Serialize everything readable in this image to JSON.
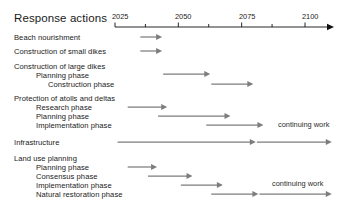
{
  "chart_data": {
    "type": "bar",
    "title": "Response actions",
    "xlabel": "",
    "ylabel": "",
    "xlim": [
      2020,
      2112
    ],
    "grid": false,
    "legend": null,
    "axis": {
      "major_ticks": [
        2025,
        2050,
        2075,
        2100
      ],
      "major_tick_labels": [
        "2025",
        "2050",
        "2075",
        "2100"
      ],
      "minor_ticks": [
        2037,
        2062,
        2087
      ],
      "arrow_end": true
    },
    "annotations": [
      "continuing work",
      "continuing work"
    ],
    "categories": [
      "Beach nourishment",
      "Construction of small dikes",
      "Construction of large dikes",
      "Planning phase",
      "Construction phase",
      "Protection of atolls and deltas",
      "Research phase",
      "Planning phase",
      "Implementation phase",
      "Infrastructure",
      "Land use planning",
      "Planning phase",
      "Consensus phase",
      "Implementation phase",
      "Natural restoration phase"
    ],
    "bars": [
      {
        "label": "Beach nourishment",
        "start": 2035,
        "end": 2043,
        "arrow": true
      },
      {
        "label": "Construction of small dikes",
        "start": 2035,
        "end": 2043,
        "arrow": true
      },
      {
        "label": "Planning phase",
        "start": 2044,
        "end": 2062,
        "arrow": true
      },
      {
        "label": "Construction phase",
        "start": 2063,
        "end": 2079,
        "arrow": true
      },
      {
        "label": "Research phase",
        "start": 2030,
        "end": 2045,
        "arrow": true
      },
      {
        "label": "Planning phase",
        "start": 2042,
        "end": 2070,
        "arrow": true
      },
      {
        "label": "Implementation phase",
        "start": 2061,
        "end": 2083,
        "arrow": true
      },
      {
        "label": "Infrastructure",
        "start": 2026,
        "end": 2080,
        "arrow": true
      },
      {
        "label": "Infrastructure",
        "start": 2081,
        "end": 2110,
        "arrow": true
      },
      {
        "label": "Planning phase",
        "start": 2030,
        "end": 2041,
        "arrow": true
      },
      {
        "label": "Consensus phase",
        "start": 2038,
        "end": 2055,
        "arrow": true
      },
      {
        "label": "Implementation phase",
        "start": 2051,
        "end": 2067,
        "arrow": true
      },
      {
        "label": "Natural restoration phase",
        "start": 2063,
        "end": 2081,
        "arrow": true
      },
      {
        "label": "Natural restoration phase",
        "start": 2082,
        "end": 2110,
        "arrow": true
      }
    ]
  },
  "header": {
    "title": "Response actions"
  },
  "axis": {
    "year_2025": "2025",
    "year_2050": "2050",
    "year_2075": "2075",
    "year_2100": "2100"
  },
  "rows": [
    {
      "label": "Beach nourishment",
      "indent": 0
    },
    {
      "label": "Construction of small dikes",
      "indent": 0
    },
    {
      "label": "Construction of large dikes",
      "indent": 0
    },
    {
      "label": "Planning phase",
      "indent": 1
    },
    {
      "label": "Construction phase",
      "indent": 2
    },
    {
      "label": "Protection of atolls and deltas",
      "indent": 0
    },
    {
      "label": "Research phase",
      "indent": 1
    },
    {
      "label": "Planning phase",
      "indent": 1
    },
    {
      "label": "Implementation phase",
      "indent": 1
    },
    {
      "label": "Infrastructure",
      "indent": 0
    },
    {
      "label": "Land use planning",
      "indent": 0
    },
    {
      "label": "Planning phase",
      "indent": 1
    },
    {
      "label": "Consensus phase",
      "indent": 1
    },
    {
      "label": "Implementation phase",
      "indent": 1
    },
    {
      "label": "Natural restoration phase",
      "indent": 1
    }
  ],
  "notes": {
    "continuing_work_1": "continuing work",
    "continuing_work_2": "continuing work"
  },
  "colors": {
    "bar": "#7d7d7d",
    "axis": "#111111",
    "text": "#1a1a1a",
    "background": "#ffffff"
  }
}
